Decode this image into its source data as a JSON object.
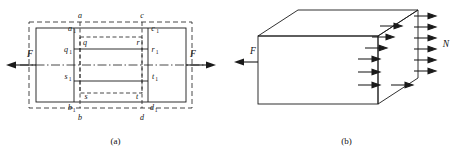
{
  "figure": {
    "panels": [
      {
        "id": "a",
        "caption": "(a)",
        "description": "axial-tension-bar-with-deformation-grid",
        "force_left_label": "F",
        "force_right_label": "F",
        "labels": {
          "a": "a",
          "a1": "a",
          "a1_sub": "1",
          "b": "b",
          "b1": "b",
          "b1_sub": "1",
          "c": "c",
          "c1": "c",
          "c1_sub": "1",
          "d": "d",
          "d1": "d",
          "d1_sub": "1",
          "q": "q",
          "q1": "q",
          "q1_sub": "1",
          "r": "r",
          "r1": "r",
          "r1_sub": "1",
          "s": "s",
          "s1": "s",
          "s1_sub": "1",
          "t": "t",
          "t1": "t",
          "t1_sub": "1"
        }
      },
      {
        "id": "b",
        "caption": "(b)",
        "description": "prismatic-block-with-distributed-normal-stress",
        "force_left_label": "F",
        "resultant_label": "N",
        "arrow_count": 7
      }
    ],
    "colors": {
      "stroke": "#1a1a1a",
      "dashed": "#1a1a1a",
      "background": "#ffffff",
      "text": "#111111"
    }
  }
}
